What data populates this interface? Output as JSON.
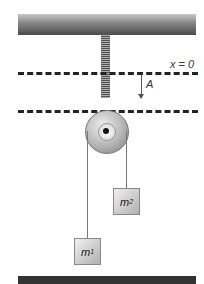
{
  "diagram": {
    "labels": {
      "equilibrium": "x = 0",
      "amplitude": "A"
    },
    "masses": [
      {
        "symbol": "m",
        "subscript": "1"
      },
      {
        "symbol": "m",
        "subscript": "2"
      }
    ]
  }
}
